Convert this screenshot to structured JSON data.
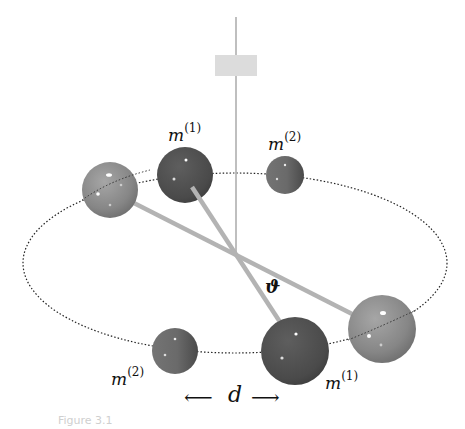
{
  "figure": {
    "labels": {
      "top_m1": {
        "base": "m",
        "sup": "(1)"
      },
      "top_m2": {
        "base": "m",
        "sup": "(2)"
      },
      "bottom_m2": {
        "base": "m",
        "sup": "(2)"
      },
      "bottom_m1": {
        "base": "m",
        "sup": "(1)"
      },
      "angle": "ϑ",
      "distance": "d",
      "arrow_left": "⟵",
      "arrow_right": "⟶"
    },
    "caption": "Figure 3.1",
    "colors": {
      "light_sphere": "#8a8a8a",
      "dark_sphere": "#4e4e4e",
      "small_sphere": "#6a6a6a",
      "rod": "#b3b3b3",
      "fiber": "#aaaaaa",
      "mirror": "#dcdcdc",
      "orbit": "#222222"
    },
    "spheres": [
      {
        "id": "left-light",
        "cx": 110,
        "cy": 190,
        "r": 28,
        "kind": "light"
      },
      {
        "id": "top-m1",
        "cx": 185,
        "cy": 175,
        "r": 28,
        "kind": "dark"
      },
      {
        "id": "top-m2",
        "cx": 285,
        "cy": 175,
        "r": 19,
        "kind": "small"
      },
      {
        "id": "bottom-m2",
        "cx": 175,
        "cy": 351,
        "r": 23,
        "kind": "small"
      },
      {
        "id": "bottom-m1",
        "cx": 295,
        "cy": 351,
        "r": 34,
        "kind": "dark"
      },
      {
        "id": "right-light",
        "cx": 382,
        "cy": 329,
        "r": 34,
        "kind": "light"
      }
    ]
  }
}
